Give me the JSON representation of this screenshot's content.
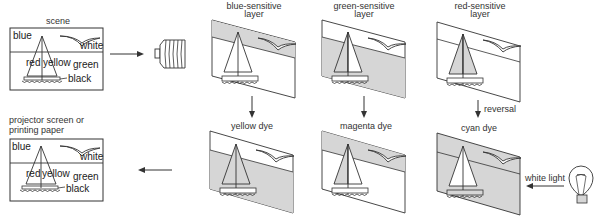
{
  "scene": {
    "label": "scene",
    "words": {
      "blue": "blue",
      "white": "white",
      "red": "red",
      "yellow": "yellow",
      "green": "green",
      "black": "black"
    }
  },
  "output": {
    "label_line1": "projector screen or",
    "label_line2": "printing paper",
    "words": {
      "blue": "blue",
      "white": "white",
      "red": "red",
      "yellow": "yellow",
      "green": "green",
      "black": "black"
    }
  },
  "layers": [
    {
      "label_line1": "blue-sensitive",
      "label_line2": "layer",
      "shade": "top"
    },
    {
      "label_line1": "green-sensitive",
      "label_line2": "layer",
      "shade": "bottom-with-sail"
    },
    {
      "label_line1": "red-sensitive",
      "label_line2": "layer",
      "shade": "left-sail"
    }
  ],
  "dyes": [
    {
      "label": "yellow dye",
      "shade": "bottom"
    },
    {
      "label": "magenta dye",
      "shade": "top-with-sail"
    },
    {
      "label": "cyan dye",
      "shade": "all-except-right-sail"
    }
  ],
  "annotations": {
    "reversal": "reversal",
    "white_light": "white light"
  },
  "icons": {
    "camera": "camera-bellows-icon",
    "bulb": "light-bulb-icon"
  },
  "colors": {
    "line": "#333333",
    "shade": "#d6d6d6",
    "background": "#ffffff"
  }
}
